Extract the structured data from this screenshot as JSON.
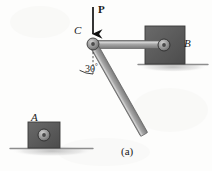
{
  "figure": {
    "caption": "(a)",
    "background_color": "#fdfdfc",
    "labels": {
      "joint_a": "A",
      "joint_b": "B",
      "joint_c": "C",
      "force": "P",
      "angle_value": "30",
      "angle_unit": "°"
    },
    "colors": {
      "bar_fill": "#9a9a9a",
      "bar_highlight": "#d2d2d2",
      "bar_edge": "#5e5e5e",
      "block_fill": "#5a5a5a",
      "block_edge": "#3a3a3a",
      "pin_fill": "#8c8c8c",
      "pin_edge": "#3c3c3c",
      "ground_line": "#8d8d8d",
      "ink": "#1a1a1a"
    },
    "geometry": {
      "pin_c": {
        "x": 93,
        "y": 44,
        "r": 6
      },
      "pin_b": {
        "x": 164,
        "y": 45,
        "r": 6
      },
      "pin_a": {
        "x": 44,
        "y": 135,
        "r": 6
      },
      "force_arrow": {
        "x": 93,
        "y_start": 7,
        "y_end": 36
      },
      "angle_degrees": 30,
      "block_b": {
        "x": 145,
        "y": 26,
        "w": 40,
        "h": 38
      },
      "block_a": {
        "x": 28,
        "y": 122,
        "w": 32,
        "h": 26
      },
      "ground_b": {
        "x1": 138,
        "x2": 208,
        "y": 64
      },
      "ground_a": {
        "x1": 10,
        "x2": 93,
        "y": 148
      }
    }
  }
}
